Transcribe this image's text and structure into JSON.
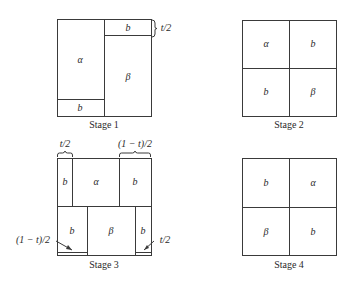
{
  "stages": [
    {
      "caption": "Stage 1",
      "regions": {
        "alpha": "α",
        "beta": "β",
        "b_top": "b",
        "b_bottom": "b"
      },
      "annotations": {
        "top_strip_height": "t/2"
      }
    },
    {
      "caption": "Stage 2",
      "regions": {
        "top_left": "α",
        "top_right": "b",
        "bottom_left": "b",
        "bottom_right": "β"
      }
    },
    {
      "caption": "Stage 3",
      "regions": {
        "top_left_b": "b",
        "top_alpha": "α",
        "top_right_b": "b",
        "bottom_left_b": "b",
        "bottom_beta": "β",
        "bottom_right_b": "b"
      },
      "annotations": {
        "top_left_width": "t/2",
        "top_right_width": "(1 − t)/2",
        "bottom_left_arrow": "(1 − t)/2",
        "bottom_right_arrow": "t/2"
      }
    },
    {
      "caption": "Stage 4",
      "regions": {
        "top_left": "b",
        "top_right": "α",
        "bottom_left": "β",
        "bottom_right": "b"
      }
    }
  ],
  "colors": {
    "line": "#3a3a3a",
    "text": "#2a2a2a",
    "background": "#ffffff"
  }
}
